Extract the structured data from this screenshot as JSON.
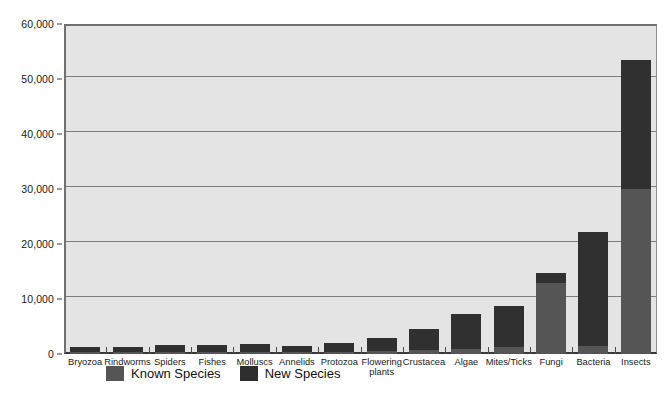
{
  "chart_data": {
    "type": "bar",
    "stacked": true,
    "title": "",
    "subtitle": "",
    "xlabel": "",
    "ylabel": "",
    "ylim": [
      0,
      60000
    ],
    "ytick_labels": [
      "60,000",
      "50,000",
      "40,000",
      "30,000",
      "20,000",
      "10,000",
      "0"
    ],
    "ytick_values": [
      60000,
      50000,
      40000,
      30000,
      20000,
      10000,
      0
    ],
    "grid": true,
    "legend_position": "bottom-left",
    "categories": [
      "Bryozoa",
      "Rindworms",
      "Spiders",
      "Fishes",
      "Molluscs",
      "Annelids",
      "Protozoa",
      "Flowering\nplants",
      "Crustacea",
      "Algae",
      "Mites/Ticks",
      "Fungi",
      "Bacteria",
      "Insects"
    ],
    "series": [
      {
        "name": "Known Species",
        "color": "#555555",
        "values": [
          300,
          300,
          300,
          300,
          400,
          300,
          400,
          500,
          700,
          900,
          1200,
          13000,
          1500,
          30000
        ]
      },
      {
        "name": "New Species",
        "color": "#303030",
        "values": [
          900,
          900,
          1300,
          1300,
          1500,
          1200,
          1600,
          2400,
          3900,
          6300,
          7500,
          1800,
          20700,
          23500
        ]
      }
    ],
    "totals": [
      1200,
      1200,
      1600,
      1600,
      1900,
      1500,
      2000,
      2900,
      4600,
      7200,
      8700,
      14800,
      22200,
      53500
    ]
  },
  "legend": {
    "entries": [
      {
        "label": "Known Species"
      },
      {
        "label": "New Species"
      }
    ]
  },
  "colors": {
    "plot_background": "#e4e4e4",
    "gridline": "#7c7c7c",
    "axis": "#3a3a3a",
    "known_species": "#555555",
    "new_species": "#303030",
    "page_background": "#ffffff"
  }
}
